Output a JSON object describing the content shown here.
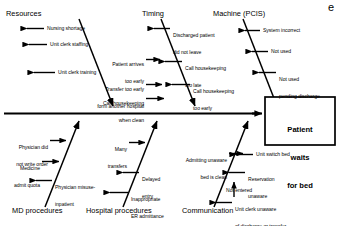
{
  "diagram": {
    "type": "fishbone-ishikawa",
    "corner_mark": "e",
    "effect": {
      "line1": "Patient",
      "line2": "waits",
      "line3": "for bed"
    },
    "categories": [
      {
        "id": "resources",
        "label": "Resources",
        "position": "top-left",
        "causes": [
          {
            "text": "Nursing shortage"
          },
          {
            "text": "Unit clerk staffing"
          },
          {
            "line1": "Patient arrives",
            "line2": "too early"
          },
          {
            "text": "Unit clerk training"
          },
          {
            "line1": "Transfer too early",
            "line2": "form another hospital"
          },
          {
            "line1": "Call housekeeping",
            "line2": "when clean"
          }
        ]
      },
      {
        "id": "timing",
        "label": "Timing",
        "position": "top-center",
        "causes": [
          {
            "line1": "Discharged patient",
            "line2": "did not leave"
          },
          {
            "line1": "Call housekeeping",
            "line2": "too late"
          },
          {
            "line1": "Call housekeeping",
            "line2": "too early"
          }
        ]
      },
      {
        "id": "machine-pcis",
        "label": "Machine (PCIS)",
        "position": "top-right",
        "causes": [
          {
            "text": "System incorrect"
          },
          {
            "text": "Not used"
          },
          {
            "line1": "Not used",
            "line2": "pending discharge"
          }
        ]
      },
      {
        "id": "md-procedures",
        "label": "MD procedures",
        "position": "bottom-left",
        "causes": [
          {
            "line1": "Physician did",
            "line2": "not write order"
          },
          {
            "line1": "Medicine",
            "line2": "admit quota"
          },
          {
            "line1": "Physician misuse-",
            "line2": "inpatient"
          }
        ]
      },
      {
        "id": "hospital-procedures",
        "label": "Hospital procedures",
        "position": "bottom-center",
        "causes": [
          {
            "line1": "Many",
            "line2": "transfers"
          },
          {
            "line1": "Admitting unaware",
            "line2": "bed is clean"
          },
          {
            "line1": "Delayed",
            "line2": "entry"
          },
          {
            "line1": "Inappropriate",
            "line2": "ER admittance"
          }
        ]
      },
      {
        "id": "communication",
        "label": "Communication",
        "position": "bottom-right",
        "causes": [
          {
            "text": "Unit switch bed"
          },
          {
            "line1": "Reservation",
            "line2": "unaware"
          },
          {
            "text": "Not entered"
          },
          {
            "line1": "Unit clerk unaware",
            "line2": "of discharge or transfer"
          }
        ]
      }
    ]
  }
}
